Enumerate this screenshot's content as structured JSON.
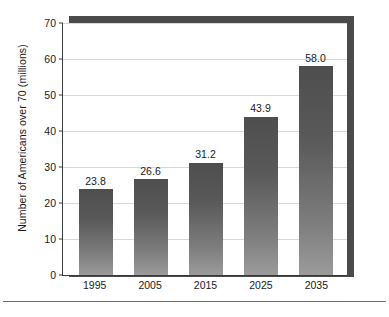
{
  "chart_data": {
    "type": "bar",
    "title": "",
    "categories": [
      "1995",
      "2005",
      "2015",
      "2025",
      "2035"
    ],
    "values": [
      23.8,
      26.6,
      31.2,
      43.9,
      58.0
    ],
    "value_labels": [
      "23.8",
      "26.6",
      "31.2",
      "43.9",
      "58.0"
    ],
    "xlabel": "",
    "ylabel": "Number of Americans over 70 (millions)",
    "ylim": [
      0,
      70
    ],
    "ytick_step": 10,
    "yticks": [
      "0",
      "10",
      "20",
      "30",
      "40",
      "50",
      "60",
      "70"
    ],
    "grid": "horizontal",
    "legend": "none",
    "bar_color_top": "#4e4e4e",
    "bar_color_bottom": "#9b9b9b",
    "gridline_color": "#d8d8d8",
    "axis_color": "#3a3a3a",
    "shadow_color": "#4a4a4a"
  }
}
